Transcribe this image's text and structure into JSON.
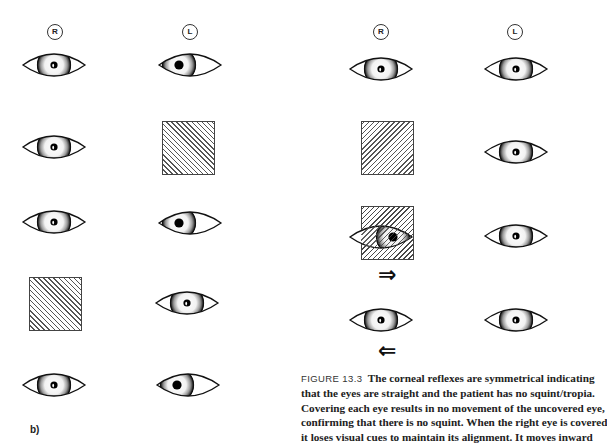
{
  "figure": {
    "panel_label": "b)",
    "column_labels": {
      "right": "R",
      "left": "L"
    },
    "arrows": {
      "right": "⇒",
      "left": "⇐"
    },
    "icons": {
      "eye": "eye-icon",
      "cover": "occluder-cover-icon",
      "arrow_right": "arrow-right-icon",
      "arrow_left": "arrow-left-icon"
    },
    "left_panel_rows": [
      {
        "right_eye": "straight",
        "left_eye": "deviated"
      },
      {
        "right_eye": "straight",
        "left_eye": "covered"
      },
      {
        "right_eye": "straight",
        "left_eye": "deviated"
      },
      {
        "right_eye": "covered",
        "left_eye": "straight"
      },
      {
        "right_eye": "straight",
        "left_eye": "deviated"
      }
    ],
    "right_panel_rows": [
      {
        "right_eye": "straight",
        "left_eye": "straight"
      },
      {
        "right_eye": "covered",
        "left_eye": "straight"
      },
      {
        "right_eye": "covered-moves-inward",
        "left_eye": "straight"
      },
      {
        "right_eye": "straight-recovering",
        "left_eye": "straight"
      }
    ]
  },
  "caption": {
    "figure_number": "FIGURE 13.3",
    "lines": [
      "The corneal reflexes are symmetrical indicating",
      "that the eyes are straight and the patient has no squint/tropia.",
      "Covering each eye results in no movement of the uncovered eye,",
      "confirming that there is no squint. When the right eye is covered",
      "it loses visual cues to maintain its alignment. It moves inward"
    ]
  },
  "colors": {
    "ink": "#1a1a1a",
    "hatch": "#555555",
    "background": "#ffffff"
  }
}
